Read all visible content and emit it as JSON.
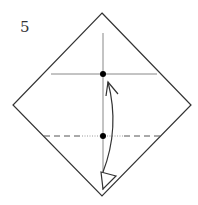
{
  "diagram": {
    "step_number": "5",
    "colors": {
      "outline": "#333333",
      "crease": "#888888",
      "valley_fold": "#555555",
      "dot": "#000000",
      "arrow": "#333333"
    },
    "paper": {
      "shape": "diamond",
      "top": [
        102,
        13
      ],
      "right": [
        191,
        105
      ],
      "bottom": [
        102,
        196
      ],
      "left": [
        13,
        105
      ]
    },
    "creases": [
      {
        "type": "horizontal",
        "y": 74,
        "x1": 51,
        "x2": 157
      },
      {
        "type": "vertical",
        "x": 103,
        "y1": 33,
        "y2": 190
      }
    ],
    "fold_line": {
      "type": "valley",
      "y": 136,
      "x1": 44,
      "x2": 160
    },
    "points": [
      {
        "label": "reference-point-top",
        "x": 103,
        "y": 74
      },
      {
        "label": "reference-point-bottom",
        "x": 103,
        "y": 136
      }
    ],
    "arrow": {
      "type": "fold-and-unfold",
      "from": [
        103,
        182
      ],
      "to": [
        108,
        82
      ]
    }
  }
}
